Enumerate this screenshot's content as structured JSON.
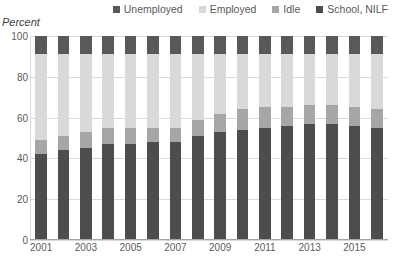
{
  "chart_data": {
    "type": "bar",
    "stacked": true,
    "stack_mode": "percent",
    "title": "",
    "xlabel": "",
    "ylabel": "Percent",
    "ylim": [
      0,
      100
    ],
    "yticks": [
      0,
      20,
      40,
      60,
      80,
      100
    ],
    "grid": true,
    "legend_position": "top-right",
    "legend_order": [
      "Unemployed",
      "Employed",
      "Idle",
      "School, NILF"
    ],
    "stack_order_bottom_to_top": [
      "School, NILF",
      "Idle",
      "Employed",
      "Unemployed"
    ],
    "categories": [
      "2001",
      "2002",
      "2003",
      "2004",
      "2005",
      "2006",
      "2007",
      "2008",
      "2009",
      "2010",
      "2011",
      "2012",
      "2013",
      "2014",
      "2015",
      "2016"
    ],
    "xtick_labels": [
      "2001",
      "2003",
      "2005",
      "2007",
      "2009",
      "2011",
      "2013",
      "2015"
    ],
    "series": [
      {
        "name": "School, NILF",
        "color": "#4d4d4d",
        "values": [
          42,
          44,
          45,
          47,
          47,
          48,
          48,
          51,
          53,
          54,
          55,
          56,
          57,
          57,
          56,
          55
        ]
      },
      {
        "name": "Idle",
        "color": "#a6a6a6",
        "values": [
          7,
          7,
          8,
          8,
          8,
          7,
          7,
          8,
          9,
          10,
          10,
          9,
          9,
          9,
          9,
          9
        ]
      },
      {
        "name": "Employed",
        "color": "#d9d9d9",
        "values": [
          42,
          40,
          38,
          36,
          36,
          36,
          36,
          32,
          29,
          27,
          26,
          26,
          25,
          25,
          26,
          27
        ]
      },
      {
        "name": "Unemployed",
        "color": "#595959",
        "values": [
          9,
          9,
          9,
          9,
          9,
          9,
          9,
          9,
          9,
          9,
          9,
          9,
          9,
          9,
          9,
          9
        ]
      }
    ]
  }
}
